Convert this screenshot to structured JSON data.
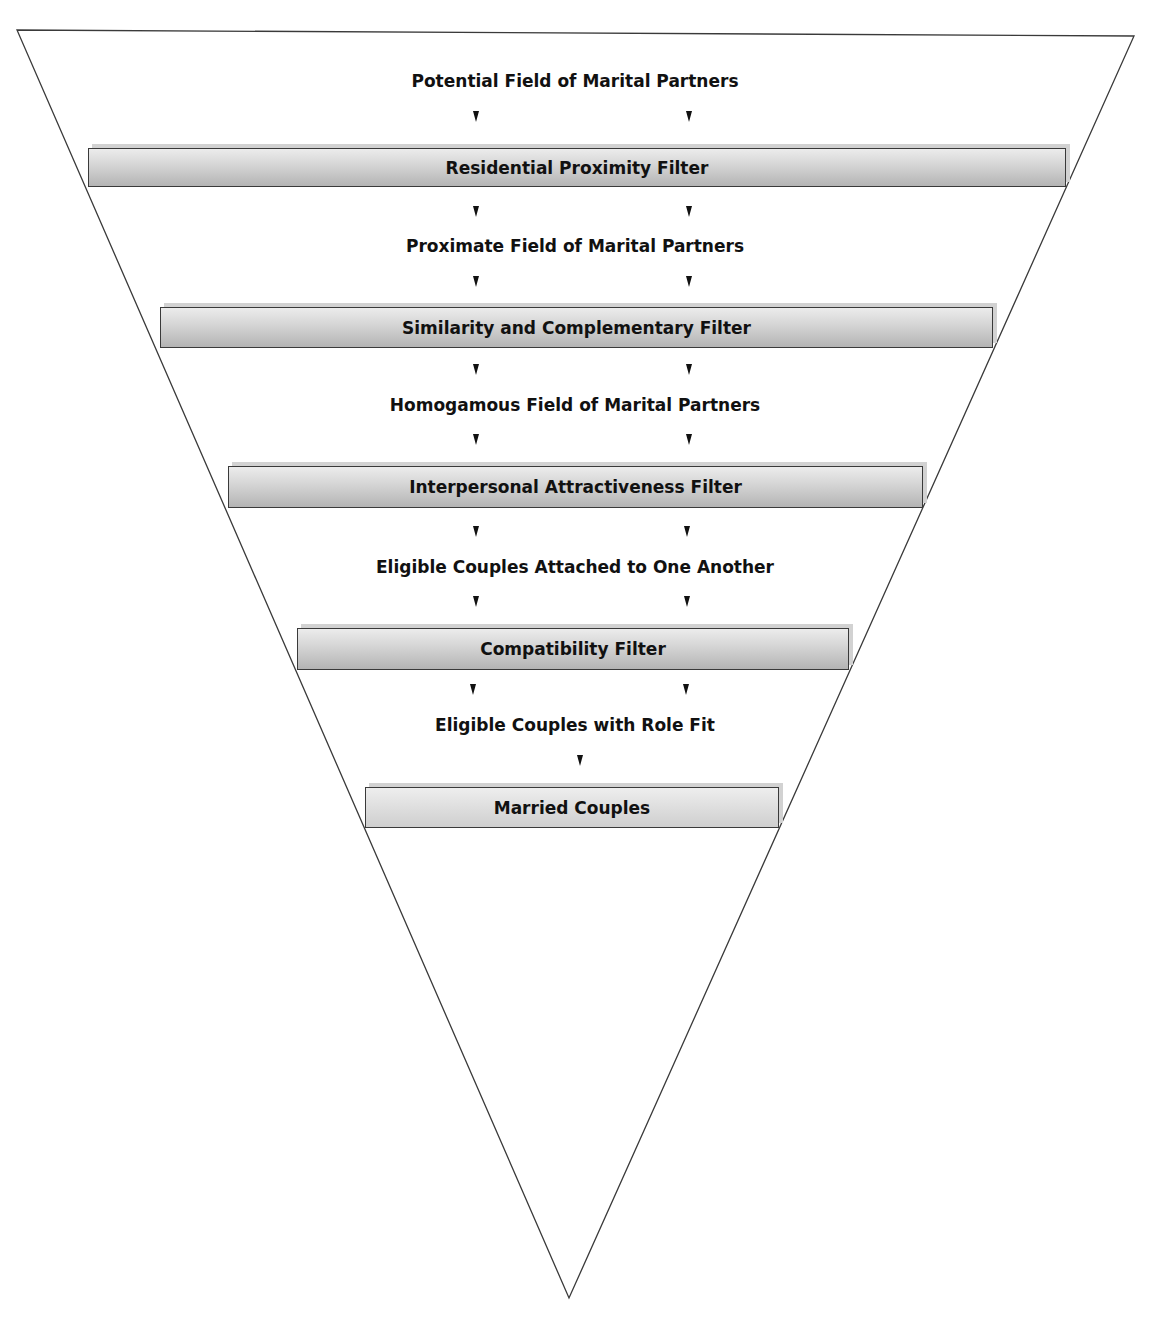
{
  "diagram": {
    "type": "inverted-funnel",
    "colors": {
      "outline": "#3a3a3a",
      "bar_top": "#ececec",
      "bar_bottom": "#b4b4b4",
      "bar_shadow": "#d2d2d2",
      "text": "#111111"
    },
    "stages": [
      {
        "label": "Potential Field of Marital Partners"
      },
      {
        "label": "Proximate Field of Marital Partners"
      },
      {
        "label": "Homogamous Field of Marital Partners"
      },
      {
        "label": "Eligible Couples Attached to One Another"
      },
      {
        "label": "Eligible Couples with Role Fit"
      }
    ],
    "filters": [
      {
        "label": "Residential Proximity Filter"
      },
      {
        "label": "Similarity and Complementary Filter"
      },
      {
        "label": "Interpersonal Attractiveness Filter"
      },
      {
        "label": "Compatibility Filter"
      },
      {
        "label": "Married Couples"
      }
    ]
  }
}
